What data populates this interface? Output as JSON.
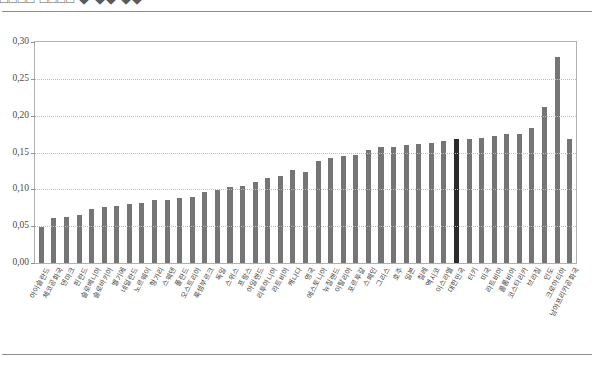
{
  "page": {
    "top_caption": "□□□□  □□□□ ◆ ◆◆ ◆◆",
    "background": "#ffffff"
  },
  "chart_data": {
    "type": "bar",
    "title": "",
    "subtitle": "",
    "xlabel": "",
    "ylabel": "",
    "ylim": [
      0.0,
      0.3
    ],
    "ytick_labels": [
      "0,00",
      "0,05",
      "0,10",
      "0,15",
      "0,20",
      "0,25",
      "0,30"
    ],
    "ytick_values": [
      0.0,
      0.05,
      0.1,
      0.15,
      0.2,
      0.25,
      0.3
    ],
    "grid": true,
    "grid_axis": "y",
    "legend": null,
    "bar_color": "#757575",
    "highlight_color": "#2b2b2b",
    "highlight_index": 33,
    "categories": [
      "아이슬란드",
      "체코공화국",
      "덴마크",
      "핀란드",
      "슬로베니아",
      "슬로바키아",
      "벨기에",
      "네덜란드",
      "노르웨이",
      "헝가리",
      "스웨덴",
      "폴란드",
      "오스트리아",
      "룩셈부르크",
      "독일",
      "스위스",
      "프랑스",
      "아일랜드",
      "리투아니아",
      "라트비아",
      "캐나다",
      "영국",
      "에스토니아",
      "뉴질랜드",
      "이탈리아",
      "포르투갈",
      "스페인",
      "그리스",
      "호주",
      "일본",
      "칠레",
      "멕시코",
      "이스라엘",
      "대한민국",
      "터키",
      "미국",
      "라트비아",
      "콜롬비아",
      "코스타리카",
      "브라질",
      "인도",
      "크로아티아",
      "남아프리카공화국"
    ],
    "values": [
      0.049,
      0.061,
      0.063,
      0.065,
      0.074,
      0.076,
      0.078,
      0.08,
      0.082,
      0.085,
      0.086,
      0.088,
      0.09,
      0.096,
      0.099,
      0.103,
      0.105,
      0.11,
      0.115,
      0.118,
      0.126,
      0.124,
      0.138,
      0.143,
      0.145,
      0.146,
      0.153,
      0.157,
      0.158,
      0.16,
      0.161,
      0.163,
      0.165,
      0.168,
      0.168,
      0.17,
      0.172,
      0.175,
      0.175,
      0.183,
      0.212,
      0.28,
      0.168
    ]
  }
}
